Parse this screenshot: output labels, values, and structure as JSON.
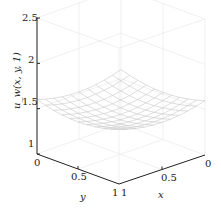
{
  "chart_data": {
    "type": "surface3d",
    "title": "",
    "zlabel": "u_w(x,y,1)",
    "xlabel": "x",
    "ylabel": "y",
    "x_ticks": [
      "0",
      "0.5",
      "1"
    ],
    "y_ticks": [
      "0",
      "0.5",
      "1"
    ],
    "z_ticks": [
      "1",
      "1.5",
      "2",
      "2.5"
    ],
    "xlim": [
      0,
      1
    ],
    "ylim": [
      0,
      1
    ],
    "zlim": [
      1,
      2.5
    ],
    "grid": true,
    "surface": {
      "description": "Mesh surface, lowest near center (~1.44), rising toward corners (~1.5-1.6)",
      "x": [
        0,
        0.1,
        0.2,
        0.3,
        0.4,
        0.5,
        0.6,
        0.7,
        0.8,
        0.9,
        1.0
      ],
      "y": [
        0,
        0.1,
        0.2,
        0.3,
        0.4,
        0.5,
        0.6,
        0.7,
        0.8,
        0.9,
        1.0
      ],
      "z_corner": 1.6,
      "z_edge_mid": 1.5,
      "z_center": 1.44
    }
  },
  "axes": {
    "zlabel": "u_w(x, y, 1)",
    "xlabel": "x",
    "ylabel": "y",
    "z_tick_labels": [
      "2.5",
      "2",
      "1.5",
      "1"
    ],
    "y_tick_labels": [
      "0",
      "0.5",
      "1"
    ],
    "x_tick_labels": [
      "0",
      "0.5",
      "1"
    ]
  }
}
